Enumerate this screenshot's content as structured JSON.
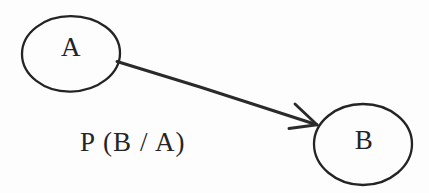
{
  "diagram": {
    "type": "conditional-probability-diagram",
    "background_color": "#fdfdfd",
    "ink_color": "#242424",
    "nodes": [
      {
        "id": "A",
        "label": "A",
        "shape": "ellipse",
        "cx": 71,
        "cy": 54,
        "rx": 49,
        "ry": 38
      },
      {
        "id": "B",
        "label": "B",
        "shape": "ellipse",
        "cx": 363,
        "cy": 145,
        "rx": 50,
        "ry": 41
      }
    ],
    "edges": [
      {
        "id": "A-to-B",
        "from": "A",
        "to": "B",
        "label": "P (B / A)",
        "directed": true,
        "start_x": 117,
        "start_y": 62,
        "end_x": 317,
        "end_y": 125
      }
    ],
    "edge_label": "P (B / A)"
  }
}
